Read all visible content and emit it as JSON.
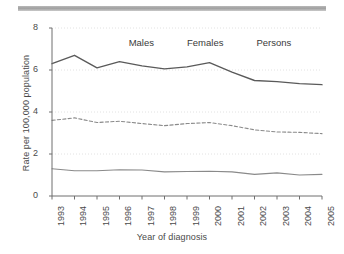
{
  "chart_data": {
    "type": "line",
    "title": "",
    "xlabel": "Year of diagnosis",
    "ylabel": "Rate per 100,000 population",
    "categories": [
      "1993",
      "1994",
      "1995",
      "1996",
      "1997",
      "1998",
      "1999",
      "2000",
      "2001",
      "2002",
      "2003",
      "2004",
      "2005"
    ],
    "x": [
      1993,
      1994,
      1995,
      1996,
      1997,
      1998,
      1999,
      2000,
      2001,
      2002,
      2003,
      2004,
      2005
    ],
    "xlim": [
      1993,
      2005
    ],
    "ylim": [
      0,
      8
    ],
    "yticks": [
      0,
      2,
      4,
      6,
      8
    ],
    "ytick_labels": [
      "0",
      "2",
      "4",
      "6",
      "8"
    ],
    "grid": true,
    "grid_style": "dotted-horizontal",
    "legend_position": "top-center",
    "series": [
      {
        "name": "Males",
        "style": "solid",
        "color": "#5a5a5a",
        "values": [
          6.3,
          6.7,
          6.1,
          6.4,
          6.2,
          6.05,
          6.15,
          6.35,
          5.9,
          5.5,
          5.45,
          5.35,
          5.3
        ]
      },
      {
        "name": "Females",
        "style": "solid",
        "color": "#8a8a8a",
        "values": [
          1.3,
          1.2,
          1.2,
          1.25,
          1.24,
          1.15,
          1.17,
          1.18,
          1.15,
          1.03,
          1.1,
          1.0,
          1.03
        ]
      },
      {
        "name": "Persons",
        "style": "dashed",
        "color": "#8a8a8a",
        "values": [
          3.6,
          3.72,
          3.5,
          3.56,
          3.45,
          3.35,
          3.45,
          3.5,
          3.35,
          3.15,
          3.05,
          3.03,
          2.97
        ]
      }
    ]
  },
  "legend": {
    "items": [
      {
        "label": "Males"
      },
      {
        "label": "Females"
      },
      {
        "label": "Persons"
      }
    ]
  },
  "decor": {
    "top_rule": ""
  }
}
